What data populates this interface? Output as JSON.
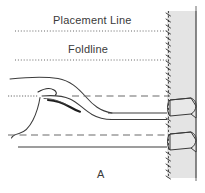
{
  "figure": {
    "caption": "A",
    "labels": {
      "placement_line": "Placement Line",
      "foldline": "Foldline"
    },
    "colors": {
      "ink": "#2b2b2b",
      "line": "#4a4a4a",
      "band_fill": "#e2e2e2",
      "band_stroke": "#6e6e6e",
      "tube_fill": "#e8e8e8",
      "background": "#ffffff"
    },
    "guide_lines": [
      {
        "name": "placement-line-guide",
        "style": "dotted",
        "y": 31,
        "x_start": 15,
        "x_end": 168
      },
      {
        "name": "foldline-guide",
        "style": "dotted",
        "y": 60,
        "x_start": 15,
        "x_end": 168
      },
      {
        "name": "upper-dashed-guide",
        "style": "dashed",
        "y": 96,
        "x_start": 8,
        "x_end": 170
      },
      {
        "name": "lower-dashed-guide",
        "style": "dashed",
        "y": 135,
        "x_start": 8,
        "x_end": 170
      }
    ],
    "solid_edges": [
      {
        "name": "upper-fabric-edge",
        "y": 113,
        "x_start": 64,
        "x_end": 167
      },
      {
        "name": "lower-fabric-edge",
        "y": 147,
        "x_start": 18,
        "x_end": 167
      }
    ],
    "band": {
      "name": "vertical-band",
      "x": 167,
      "y": 11,
      "width": 29,
      "height": 167,
      "edge_line_x": 196,
      "stitch_line_x": 168
    },
    "tubes": [
      {
        "name": "upper-loop",
        "y": 98,
        "height": 17
      },
      {
        "name": "lower-loop",
        "y": 132,
        "height": 17
      }
    ]
  }
}
